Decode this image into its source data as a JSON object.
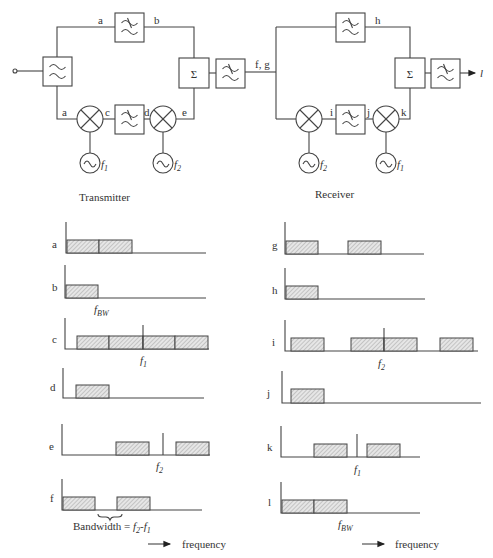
{
  "transmitter": {
    "caption": "Transmitter",
    "nodes": {
      "a_top": "a",
      "b": "b",
      "a_bottom": "a",
      "c": "c",
      "d": "d",
      "e": "e",
      "fg": "f, g"
    },
    "oscillators": {
      "left": {
        "sym": "f",
        "sub": "1"
      },
      "right": {
        "sym": "f",
        "sub": "2"
      }
    },
    "sum_symbol": "Σ"
  },
  "receiver": {
    "caption": "Receiver",
    "nodes": {
      "h": "h",
      "i": "i",
      "j": "j",
      "k": "k",
      "output": "l"
    },
    "oscillators": {
      "left": {
        "sym": "f",
        "sub": "2"
      },
      "right": {
        "sym": "f",
        "sub": "1"
      }
    },
    "sum_symbol": "Σ"
  },
  "spectra": {
    "left": [
      {
        "label": "a",
        "annotation": ""
      },
      {
        "label": "b",
        "annotation": "f_BW",
        "ann_sym": "f",
        "ann_sub": "BW"
      },
      {
        "label": "c",
        "annotation": "f_1",
        "ann_sym": "f",
        "ann_sub": "1"
      },
      {
        "label": "d",
        "annotation": ""
      },
      {
        "label": "e",
        "annotation": "f_2",
        "ann_sym": "f",
        "ann_sub": "2"
      },
      {
        "label": "f",
        "annotation": ""
      }
    ],
    "right": [
      {
        "label": "g",
        "annotation": ""
      },
      {
        "label": "h",
        "annotation": ""
      },
      {
        "label": "i",
        "annotation": "f_2",
        "ann_sym": "f",
        "ann_sub": "2"
      },
      {
        "label": "j",
        "annotation": ""
      },
      {
        "label": "k",
        "annotation": "f_1",
        "ann_sym": "f",
        "ann_sub": "1"
      },
      {
        "label": "l",
        "annotation": "f_BW",
        "ann_sym": "f",
        "ann_sub": "BW"
      }
    ],
    "bandwidth_note": {
      "prefix": "Bandwidth = ",
      "f2": "f",
      "f2_sub": "2",
      "dash": "-",
      "f1": "f",
      "f1_sub": "1"
    },
    "frequency_label": "frequency"
  }
}
